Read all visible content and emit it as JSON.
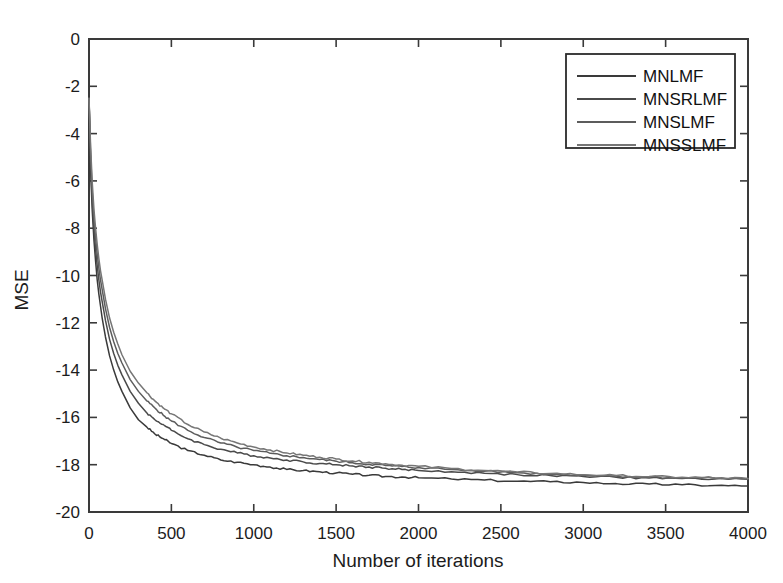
{
  "chart_data": {
    "type": "line",
    "title": "",
    "xlabel": "Number of iterations",
    "ylabel": "MSE",
    "xlim": [
      0,
      4000
    ],
    "ylim": [
      -20,
      0
    ],
    "xticks": [
      0,
      500,
      1000,
      1500,
      2000,
      2500,
      3000,
      3500,
      4000
    ],
    "xtick_labels": [
      "0",
      "500",
      "1000",
      "1500",
      "2000",
      "2500",
      "3000",
      "3500",
      "4000"
    ],
    "yticks": [
      0,
      -2,
      -4,
      -6,
      -8,
      -10,
      -12,
      -14,
      -16,
      -18,
      -20
    ],
    "ytick_labels": [
      "0",
      "-2",
      "-4",
      "-6",
      "-8",
      "-10",
      "-12",
      "-14",
      "-16",
      "-18",
      "-20"
    ],
    "grid": false,
    "legend_position": "upper right",
    "legend_entries": [
      "MNLMF",
      "MNSRLMF",
      "MNSLMF",
      "MNSSLMF"
    ],
    "x": [
      0,
      10,
      20,
      30,
      40,
      50,
      60,
      70,
      80,
      90,
      100,
      125,
      150,
      175,
      200,
      250,
      300,
      350,
      400,
      450,
      500,
      600,
      700,
      800,
      900,
      1000,
      1100,
      1200,
      1300,
      1400,
      1500,
      1600,
      1700,
      1800,
      1900,
      2000,
      2200,
      2400,
      2600,
      2800,
      3000,
      3200,
      3400,
      3600,
      3800,
      4000
    ],
    "series": [
      {
        "name": "MNLMF",
        "color": "#3a3a3a",
        "values": [
          -2.5,
          -5.6,
          -7.3,
          -8.5,
          -9.4,
          -10.2,
          -10.8,
          -11.3,
          -11.8,
          -12.2,
          -12.6,
          -13.4,
          -14.0,
          -14.5,
          -14.9,
          -15.6,
          -16.1,
          -16.4,
          -16.7,
          -16.9,
          -17.1,
          -17.4,
          -17.6,
          -17.8,
          -17.9,
          -18.0,
          -18.1,
          -18.2,
          -18.25,
          -18.3,
          -18.35,
          -18.4,
          -18.45,
          -18.5,
          -18.52,
          -18.55,
          -18.6,
          -18.65,
          -18.7,
          -18.72,
          -18.75,
          -18.8,
          -18.82,
          -18.85,
          -18.88,
          -18.9
        ]
      },
      {
        "name": "MNSRLMF",
        "color": "#4a4a4a",
        "values": [
          -2.5,
          -5.2,
          -6.9,
          -8.0,
          -8.9,
          -9.6,
          -10.2,
          -10.7,
          -11.1,
          -11.5,
          -11.9,
          -12.7,
          -13.3,
          -13.8,
          -14.2,
          -14.9,
          -15.4,
          -15.8,
          -16.1,
          -16.3,
          -16.55,
          -16.9,
          -17.15,
          -17.35,
          -17.5,
          -17.62,
          -17.72,
          -17.8,
          -17.88,
          -17.95,
          -18.0,
          -18.05,
          -18.1,
          -18.15,
          -18.2,
          -18.24,
          -18.3,
          -18.36,
          -18.42,
          -18.46,
          -18.5,
          -18.53,
          -18.56,
          -18.58,
          -18.6,
          -18.62
        ]
      },
      {
        "name": "MNSLMF",
        "color": "#5c5c5c",
        "values": [
          -2.5,
          -4.9,
          -6.5,
          -7.6,
          -8.4,
          -9.1,
          -9.7,
          -10.2,
          -10.6,
          -11.0,
          -11.4,
          -12.2,
          -12.8,
          -13.3,
          -13.7,
          -14.4,
          -14.9,
          -15.3,
          -15.6,
          -15.9,
          -16.15,
          -16.55,
          -16.85,
          -17.08,
          -17.26,
          -17.4,
          -17.52,
          -17.62,
          -17.7,
          -17.78,
          -17.85,
          -17.92,
          -17.98,
          -18.03,
          -18.08,
          -18.12,
          -18.2,
          -18.28,
          -18.34,
          -18.4,
          -18.44,
          -18.48,
          -18.52,
          -18.55,
          -18.57,
          -18.6
        ]
      },
      {
        "name": "MNSSLMF",
        "color": "#767676",
        "values": [
          -2.5,
          -4.6,
          -6.1,
          -7.2,
          -8.0,
          -8.7,
          -9.3,
          -9.8,
          -10.2,
          -10.6,
          -11.0,
          -11.8,
          -12.4,
          -12.9,
          -13.35,
          -14.05,
          -14.55,
          -14.95,
          -15.3,
          -15.6,
          -15.85,
          -16.3,
          -16.62,
          -16.88,
          -17.08,
          -17.25,
          -17.38,
          -17.5,
          -17.6,
          -17.68,
          -17.76,
          -17.84,
          -17.9,
          -17.96,
          -18.02,
          -18.07,
          -18.16,
          -18.24,
          -18.31,
          -18.37,
          -18.42,
          -18.46,
          -18.5,
          -18.53,
          -18.56,
          -18.58
        ]
      }
    ]
  }
}
